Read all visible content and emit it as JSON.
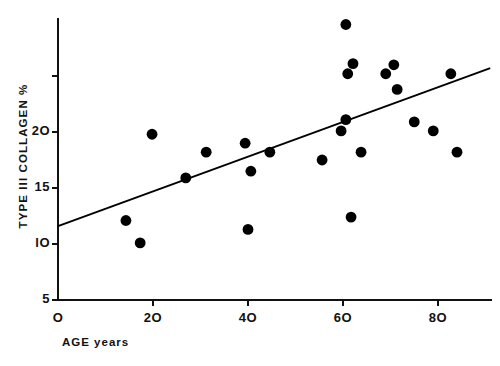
{
  "chart_data": {
    "type": "scatter",
    "title": "",
    "xlabel": "AGE years",
    "ylabel": "TYPE III COLLAGEN %",
    "xlim": [
      0,
      92
    ],
    "ylim": [
      5,
      31
    ],
    "grid": false,
    "legend": "none",
    "x_ticks": [
      {
        "value": 0,
        "label": "O"
      },
      {
        "value": 20,
        "label": "2O"
      },
      {
        "value": 40,
        "label": "4O"
      },
      {
        "value": 60,
        "label": "6O"
      },
      {
        "value": 80,
        "label": "8O"
      }
    ],
    "y_ticks": [
      {
        "value": 5,
        "label": "5"
      },
      {
        "value": 10,
        "label": "lO"
      },
      {
        "value": 15,
        "label": "15"
      },
      {
        "value": 20,
        "label": "2O"
      },
      {
        "value": 25,
        "label": ""
      }
    ],
    "marker": {
      "shape": "circle",
      "color": "#000000",
      "size": 5.4
    },
    "points": [
      {
        "x": 14.3,
        "y": 12.1
      },
      {
        "x": 17.3,
        "y": 10.1
      },
      {
        "x": 19.8,
        "y": 19.8
      },
      {
        "x": 26.9,
        "y": 15.9
      },
      {
        "x": 31.2,
        "y": 18.2
      },
      {
        "x": 39.4,
        "y": 19.0
      },
      {
        "x": 40.0,
        "y": 11.3
      },
      {
        "x": 40.6,
        "y": 16.5
      },
      {
        "x": 44.6,
        "y": 18.2
      },
      {
        "x": 55.6,
        "y": 17.5
      },
      {
        "x": 59.6,
        "y": 20.1
      },
      {
        "x": 60.6,
        "y": 29.6
      },
      {
        "x": 60.6,
        "y": 21.1
      },
      {
        "x": 61.0,
        "y": 25.2
      },
      {
        "x": 61.7,
        "y": 12.4
      },
      {
        "x": 62.1,
        "y": 26.1
      },
      {
        "x": 63.8,
        "y": 18.2
      },
      {
        "x": 69.0,
        "y": 25.2
      },
      {
        "x": 70.7,
        "y": 26.0
      },
      {
        "x": 71.4,
        "y": 23.8
      },
      {
        "x": 75.0,
        "y": 20.9
      },
      {
        "x": 79.0,
        "y": 20.1
      },
      {
        "x": 82.7,
        "y": 25.2
      },
      {
        "x": 84.0,
        "y": 18.2
      }
    ],
    "trend_line": {
      "type": "linear-regression",
      "color": "#000000",
      "x_start": 0,
      "y_start": 11.6,
      "x_end": 91,
      "y_end": 25.7
    }
  }
}
